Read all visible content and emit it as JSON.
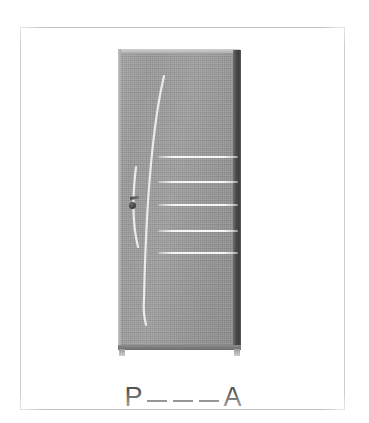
{
  "card": {
    "type": "vocabulary-flashcard",
    "background_color": "#ffffff",
    "frame_color": "#8e8e8e",
    "alt_description": "Photograph of a grey panelled interior door with horizontal slats and a door handle on the left side"
  },
  "photo": {
    "subject": "door",
    "door_color": "#9d9d9d",
    "jamb_color": "#3d3d3d",
    "handle_color": "#3b3b3b",
    "slat_highlight_color": "#fafafa",
    "slat_count": 5,
    "slats": [
      {
        "left": 40,
        "top": 107,
        "width": 80
      },
      {
        "left": 40,
        "top": 132,
        "width": 80
      },
      {
        "left": 40,
        "top": 155,
        "width": 80
      },
      {
        "left": 40,
        "top": 181,
        "width": 80
      },
      {
        "left": 40,
        "top": 203,
        "width": 80
      }
    ],
    "glare_streaks": [
      {
        "name": "long-curve",
        "path": "M 46 27 C 34 78, 28 160, 26 250 C 25 262, 26 268, 28 276"
      },
      {
        "name": "short-curve",
        "path": "M 18 118 C 14 150, 15 178, 20 198"
      }
    ]
  },
  "puzzle": {
    "label": "P___A",
    "first_letter": "P",
    "last_letter": "A",
    "blank_count": 3,
    "blanks": [
      "_",
      "_",
      "_"
    ],
    "text_color": "#555555"
  }
}
